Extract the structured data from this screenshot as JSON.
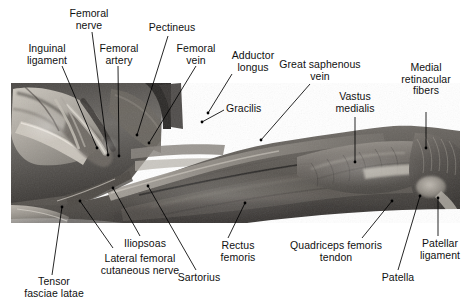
{
  "figure": {
    "image_type": "grayscale anatomical dissection photograph",
    "background_color": "#ffffff",
    "label_color": "#111111",
    "leader_color": "#000000"
  },
  "labels": [
    {
      "id": "femoral-nerve",
      "text": "Femoral\nnerve"
    },
    {
      "id": "pectineus",
      "text": "Pectineus"
    },
    {
      "id": "inguinal-ligament",
      "text": "Inguinal\nligament"
    },
    {
      "id": "femoral-artery",
      "text": "Femoral\nartery"
    },
    {
      "id": "femoral-vein",
      "text": "Femoral\nvein"
    },
    {
      "id": "adductor-longus",
      "text": "Adductor\nlongus"
    },
    {
      "id": "great-saphenous-vein",
      "text": "Great saphenous\nvein"
    },
    {
      "id": "vastus-medialis",
      "text": "Vastus\nmedialis"
    },
    {
      "id": "medial-retinacular-fibers",
      "text": "Medial\nretinacular\nfibers"
    },
    {
      "id": "gracilis",
      "text": "Gracilis"
    },
    {
      "id": "tensor-fasciae-latae",
      "text": "Tensor\nfasciae latae"
    },
    {
      "id": "lateral-femoral-cutaneous-nerve",
      "text": "Lateral femoral\ncutaneous nerve"
    },
    {
      "id": "iliopsoas",
      "text": "Iliopsoas"
    },
    {
      "id": "sartorius",
      "text": "Sartorius"
    },
    {
      "id": "rectus-femoris",
      "text": "Rectus\nfemoris"
    },
    {
      "id": "quadriceps-femoris-tendon",
      "text": "Quadriceps femoris\ntendon"
    },
    {
      "id": "patella",
      "text": "Patella"
    },
    {
      "id": "patellar-ligament",
      "text": "Patellar\nligament"
    }
  ]
}
